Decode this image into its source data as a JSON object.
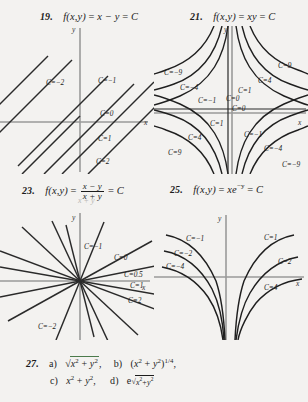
{
  "page": {
    "background": "#f3f2f0",
    "ink": "#1c1c1c"
  },
  "problems": [
    {
      "number": "19.",
      "statement_plain": "f(x,y) = x - y = C",
      "fn_label": "f(x,y)",
      "equals": "=",
      "expr": "x − y",
      "equals2": "=",
      "const": "C",
      "plot": {
        "type": "contour",
        "family": "parallel-lines",
        "axes": {
          "x": "x",
          "y": "y"
        },
        "levels": [
          "C=−2",
          "C=−1",
          "C=0",
          "C=1",
          "C=2"
        ]
      }
    },
    {
      "number": "21.",
      "statement_plain": "f(x,y) = xy = C",
      "fn_label": "f(x,y)",
      "equals": "=",
      "expr": "xy",
      "equals2": "=",
      "const": "C",
      "plot": {
        "type": "contour",
        "family": "hyperbolas",
        "axes": {
          "x": "x",
          "y": "y"
        },
        "levels": [
          "C=−9",
          "C=−4",
          "C=−1",
          "C=0",
          "C=1",
          "C=4",
          "C=9"
        ]
      }
    },
    {
      "number": "23.",
      "statement_plain": "f(x,y) = (x - y)/(x + y) = C",
      "fn_label": "f(x,y)",
      "equals": "=",
      "numerator": "x − y",
      "denominator": "x + y",
      "equals2": "=",
      "const": "C",
      "plot": {
        "type": "contour",
        "family": "lines-through-origin",
        "axes": {
          "x": "x",
          "y": "y"
        },
        "levels": [
          "C=−1",
          "C=0",
          "C=0.5",
          "C=1",
          "C=2",
          "C=−2"
        ]
      }
    },
    {
      "number": "25.",
      "statement_plain": "f(x,y) = x e^{-y} = C",
      "fn_label": "f(x,y)",
      "equals": "=",
      "expr_base": "xe",
      "expr_sup": "−y",
      "equals2": "=",
      "const": "C",
      "plot": {
        "type": "contour",
        "family": "exponential-curves",
        "axes": {
          "x": "x",
          "y": "y"
        },
        "levels": [
          "C=−1",
          "C=−2",
          "C=−4",
          "C=1",
          "C=2",
          "C=4"
        ]
      }
    },
    {
      "number": "27.",
      "statement_plain": "a) sqrt(x^2+y^2), b) (x^2+y^2)^(1/4), c) x^2+y^2, d) e^sqrt(x^2+y^2)",
      "parts": [
        {
          "tag": "a)",
          "body": "√(x² + y²),"
        },
        {
          "tag": "b)",
          "body": "(x² + y²)^{1/4},"
        },
        {
          "tag": "c)",
          "body": "x² + y²,"
        },
        {
          "tag": "d)",
          "body": "e^{√(x²+y²)}"
        }
      ]
    }
  ],
  "glyphs": {
    "x_var": "x",
    "y_var": "y",
    "C_const": "C",
    "minus": "−",
    "plus": "+",
    "eq": "=",
    "comma": ",",
    "sqrt": "√",
    "e_base": "e"
  },
  "labels_19": [
    "C=−2",
    "C=−1",
    "C=0",
    "C=1",
    "C=2"
  ],
  "labels_21_upper_left": [
    "C=−9",
    "C=−4",
    "C=−1"
  ],
  "labels_21_upper_right": [
    "C=9",
    "C=4",
    "C=1",
    "C=0"
  ],
  "labels_21_center": [
    "C=0",
    "C=0"
  ],
  "labels_21_lower_left": [
    "C=1",
    "C=4",
    "C=9"
  ],
  "labels_21_lower_right": [
    "C=−1",
    "C=−4",
    "C=−9"
  ],
  "labels_23": [
    "C=−1",
    "C=0",
    "C=0.5",
    "C=1",
    "C=2",
    "C=−2"
  ],
  "labels_25_left": [
    "C=−1",
    "C=−2",
    "C=−4"
  ],
  "labels_25_right": [
    "C=1",
    "C=2",
    "C=4"
  ],
  "axis_names": {
    "x": "x",
    "y": "y"
  }
}
